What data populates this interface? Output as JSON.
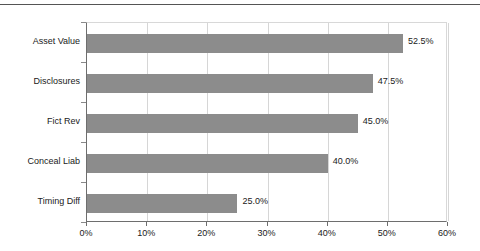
{
  "chart_data": {
    "type": "bar",
    "orientation": "horizontal",
    "title": "",
    "subtitle": "",
    "xlabel": "",
    "ylabel": "",
    "xlim": [
      0,
      60
    ],
    "grid": true,
    "legend": false,
    "legend_position": "none",
    "bar_color": "#8c8c8c",
    "categories": [
      "Asset Value",
      "Disclosures",
      "Fict Rev",
      "Conceal Liab",
      "Timing Diff"
    ],
    "values": [
      52.5,
      47.5,
      45.0,
      40.0,
      25.0
    ],
    "value_labels": [
      "52.5%",
      "47.5%",
      "45.0%",
      "40.0%",
      "25.0%"
    ],
    "xticks": [
      0,
      10,
      20,
      30,
      40,
      50,
      60
    ],
    "xtick_labels": [
      "0%",
      "10%",
      "20%",
      "30%",
      "40%",
      "50%",
      "60%"
    ]
  }
}
